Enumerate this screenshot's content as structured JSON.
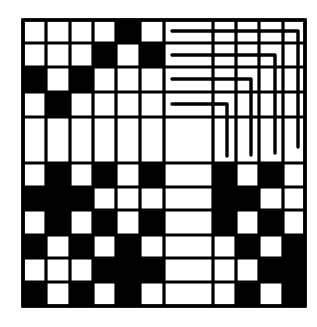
{
  "figure": {
    "colors": {
      "background": "#ffffff",
      "ink": "#000000",
      "empty_cell": "#ffffff",
      "filled_cell": "#000000"
    },
    "grid": {
      "col_edges": [
        23,
        46,
        70,
        93,
        116,
        140,
        164,
        213,
        236,
        259,
        283,
        305
      ],
      "row_edges": [
        20,
        43,
        67,
        92,
        117,
        163,
        187,
        210,
        235,
        258,
        282,
        306
      ],
      "line_width": 3.2,
      "border_width": 3.6,
      "cells": [
        [
          0,
          0,
          0,
          0,
          1,
          0,
          0,
          0,
          0,
          0,
          0
        ],
        [
          0,
          0,
          0,
          1,
          0,
          1,
          0,
          0,
          0,
          0,
          0
        ],
        [
          1,
          0,
          1,
          0,
          0,
          0,
          0,
          0,
          0,
          0,
          0
        ],
        [
          0,
          1,
          0,
          0,
          0,
          0,
          0,
          0,
          0,
          0,
          0
        ],
        [
          0,
          0,
          0,
          0,
          0,
          0,
          0,
          0,
          0,
          0,
          0
        ],
        [
          0,
          1,
          0,
          1,
          0,
          1,
          0,
          1,
          0,
          1,
          0
        ],
        [
          1,
          1,
          1,
          0,
          0,
          0,
          0,
          1,
          1,
          0,
          0
        ],
        [
          0,
          1,
          0,
          1,
          0,
          1,
          0,
          1,
          0,
          1,
          0
        ],
        [
          1,
          0,
          1,
          0,
          1,
          0,
          0,
          0,
          1,
          0,
          1
        ],
        [
          0,
          0,
          0,
          1,
          1,
          1,
          0,
          0,
          0,
          1,
          1
        ],
        [
          1,
          0,
          1,
          0,
          1,
          0,
          0,
          0,
          1,
          0,
          1
        ]
      ]
    },
    "threading_lines": [
      {
        "start_x": 172,
        "y": 31,
        "corner_x": 298,
        "end_y": 147
      },
      {
        "start_x": 172,
        "y": 55,
        "corner_x": 275,
        "end_y": 153
      },
      {
        "start_x": 172,
        "y": 79,
        "corner_x": 251,
        "end_y": 155
      },
      {
        "start_x": 172,
        "y": 104,
        "corner_x": 227,
        "end_y": 156
      }
    ],
    "threading_line_width": 3.4
  }
}
